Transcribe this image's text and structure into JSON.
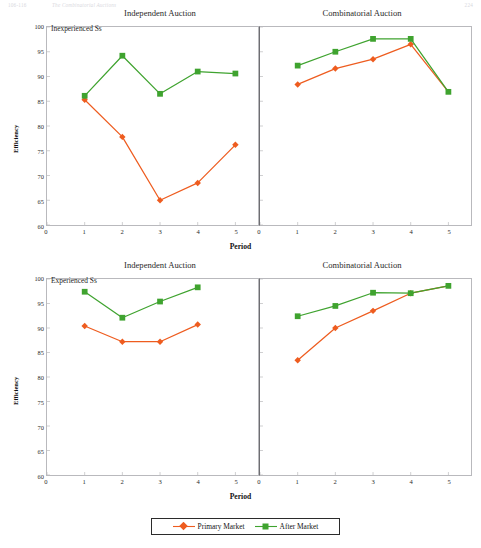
{
  "runhead": {
    "left": "106-116",
    "middle": "The Combinatorial Auctions",
    "right": "224"
  },
  "figure": {
    "xlabel": "Period",
    "ylabel": "Efficiency",
    "column_titles": [
      "Independent Auction",
      "Combinatorial Auction"
    ],
    "row_labels": [
      "Inexperienced Ss",
      "Experienced Ss"
    ],
    "ytick_labels": [
      "60",
      "65",
      "70",
      "75",
      "80",
      "85",
      "90",
      "95",
      "100"
    ],
    "xtick_labels": [
      "0",
      "1",
      "2",
      "3",
      "4",
      "5"
    ]
  },
  "legend": {
    "position": "bottom-center",
    "items": [
      {
        "label": "Primary Market",
        "color": "#ee5c1f",
        "marker": "diamond"
      },
      {
        "label": "After Market",
        "color": "#3fa32f",
        "marker": "square"
      }
    ]
  },
  "colors": {
    "primary_market": "#ee5c1f",
    "after_market": "#3fa32f",
    "axis": "#b9b9bd",
    "divider": "#6e6e72",
    "text": "#1a1a1a"
  },
  "chart_data": [
    {
      "type": "line",
      "title": "Independent Auction",
      "subtitle": "Inexperienced Ss",
      "xlabel": "Period",
      "ylabel": "Efficiency",
      "xlim": [
        0,
        5.6
      ],
      "ylim": [
        60,
        100
      ],
      "xticks": [
        0,
        1,
        2,
        3,
        4,
        5
      ],
      "yticks": [
        60,
        65,
        70,
        75,
        80,
        85,
        90,
        95,
        100
      ],
      "grid": false,
      "x": [
        1,
        2,
        3,
        4,
        5
      ],
      "series": [
        {
          "name": "Primary Market",
          "marker": "diamond",
          "color": "#ee5c1f",
          "values": [
            85.3,
            77.8,
            65.0,
            68.5,
            76.2
          ]
        },
        {
          "name": "After Market",
          "marker": "square",
          "color": "#3fa32f",
          "values": [
            86.1,
            94.2,
            86.5,
            91.0,
            90.6
          ]
        }
      ]
    },
    {
      "type": "line",
      "title": "Combinatorial Auction",
      "subtitle": "Inexperienced Ss",
      "xlabel": "Period",
      "ylabel": "Efficiency",
      "xlim": [
        0,
        5.6
      ],
      "ylim": [
        60,
        100
      ],
      "xticks": [
        0,
        1,
        2,
        3,
        4,
        5
      ],
      "yticks": [
        60,
        65,
        70,
        75,
        80,
        85,
        90,
        95,
        100
      ],
      "grid": false,
      "x": [
        1,
        2,
        3,
        4,
        5
      ],
      "series": [
        {
          "name": "Primary Market",
          "marker": "diamond",
          "color": "#ee5c1f",
          "values": [
            88.4,
            91.6,
            93.5,
            96.5,
            null
          ]
        },
        {
          "name": "After Market",
          "marker": "square",
          "color": "#3fa32f",
          "values": [
            92.2,
            95.0,
            97.6,
            97.6,
            86.9
          ]
        }
      ]
    },
    {
      "type": "line",
      "title": "Independent Auction",
      "subtitle": "Experienced Ss",
      "xlabel": "Period",
      "ylabel": "Efficiency",
      "xlim": [
        0,
        5.6
      ],
      "ylim": [
        60,
        100
      ],
      "xticks": [
        0,
        1,
        2,
        3,
        4,
        5
      ],
      "yticks": [
        60,
        65,
        70,
        75,
        80,
        85,
        90,
        95,
        100
      ],
      "grid": false,
      "x": [
        1,
        2,
        3,
        4
      ],
      "series": [
        {
          "name": "Primary Market",
          "marker": "diamond",
          "color": "#ee5c1f",
          "values": [
            90.4,
            87.2,
            87.2,
            90.7
          ]
        },
        {
          "name": "After Market",
          "marker": "square",
          "color": "#3fa32f",
          "values": [
            97.4,
            92.1,
            95.4,
            98.3
          ]
        }
      ]
    },
    {
      "type": "line",
      "title": "Combinatorial Auction",
      "subtitle": "Experienced Ss",
      "xlabel": "Period",
      "ylabel": "Efficiency",
      "xlim": [
        0,
        5.6
      ],
      "ylim": [
        60,
        100
      ],
      "xticks": [
        0,
        1,
        2,
        3,
        4,
        5
      ],
      "yticks": [
        60,
        65,
        70,
        75,
        80,
        85,
        90,
        95,
        100
      ],
      "grid": false,
      "x": [
        1,
        2,
        3,
        4,
        5
      ],
      "series": [
        {
          "name": "Primary Market",
          "marker": "diamond",
          "color": "#ee5c1f",
          "values": [
            83.4,
            90.0,
            93.5,
            97.1,
            null
          ]
        },
        {
          "name": "After Market",
          "marker": "square",
          "color": "#3fa32f",
          "values": [
            92.4,
            94.5,
            97.2,
            97.1,
            98.6
          ]
        }
      ]
    }
  ]
}
